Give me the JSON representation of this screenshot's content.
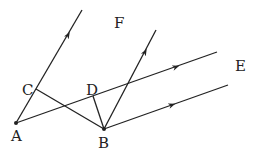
{
  "diagram": {
    "type": "geometry",
    "points": {
      "A": {
        "label": "A",
        "x": 16,
        "y": 123
      },
      "B": {
        "label": "B",
        "x": 104,
        "y": 129
      },
      "C": {
        "label": "C",
        "x": 36,
        "y": 89
      },
      "D": {
        "label": "D",
        "x": 93,
        "y": 96
      }
    },
    "labels": {
      "A": "A",
      "B": "B",
      "C": "C",
      "D": "D",
      "E": "E",
      "F": "F"
    },
    "segments": [
      {
        "from": "C",
        "to": "B"
      },
      {
        "from": "D",
        "to": "B"
      }
    ],
    "rays": [
      {
        "name": "ray-AF",
        "from": "A",
        "through": "C",
        "direction": "F"
      },
      {
        "name": "ray-AE",
        "from": "A",
        "through": "D",
        "direction": "E"
      },
      {
        "name": "ray-B-up",
        "from": "B",
        "direction": "parallel to AF"
      },
      {
        "name": "ray-B-right",
        "from": "B",
        "direction": "parallel to AE"
      }
    ]
  }
}
